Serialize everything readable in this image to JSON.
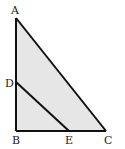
{
  "diagram": {
    "type": "geometry",
    "fill_color": "#e6e6e6",
    "stroke_color": "#111111",
    "points": {
      "A": {
        "label": "A",
        "x": 16,
        "y": 18
      },
      "B": {
        "label": "B",
        "x": 16,
        "y": 131
      },
      "C": {
        "label": "C",
        "x": 106,
        "y": 131
      },
      "D": {
        "label": "D",
        "x": 16,
        "y": 82
      },
      "E": {
        "label": "E",
        "x": 69,
        "y": 131
      }
    },
    "segments": [
      "AB",
      "BC",
      "CA",
      "DE"
    ]
  }
}
